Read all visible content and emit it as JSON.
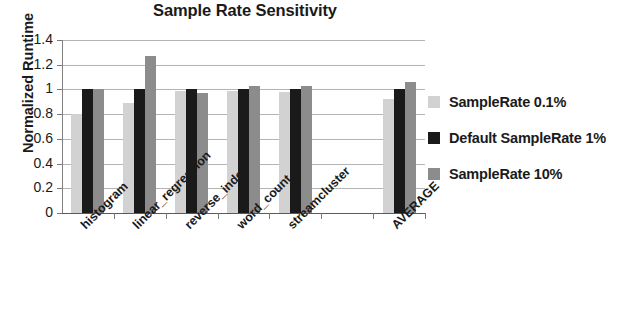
{
  "chart_data": {
    "type": "bar",
    "title": "Sample Rate Sensitivity",
    "xlabel": "",
    "ylabel": "Normalized Runtime",
    "ylim": [
      0,
      1.4
    ],
    "yticks": [
      "0",
      "0.2",
      "0.4",
      "0.6",
      "0.8",
      "1",
      "1.2",
      "1.4"
    ],
    "grid": true,
    "legend_position": "right",
    "categories": [
      "histogram",
      "linear_regression",
      "reverse_index",
      "word_count",
      "streamcluster",
      "",
      "AVERAGE"
    ],
    "series": [
      {
        "name": "SampleRate 0.1%",
        "color": "#d2d2d2",
        "values": [
          0.8,
          0.89,
          0.99,
          0.99,
          0.98,
          null,
          0.92
        ]
      },
      {
        "name": "Default SampleRate 1%",
        "color": "#1a1a1a",
        "values": [
          1.0,
          1.0,
          1.0,
          1.0,
          1.0,
          null,
          1.0
        ]
      },
      {
        "name": "SampleRate 10%",
        "color": "#8c8c8c",
        "values": [
          1.0,
          1.27,
          0.97,
          1.03,
          1.03,
          null,
          1.06
        ]
      }
    ]
  },
  "legend": {
    "items": [
      {
        "label": "SampleRate 0.1%"
      },
      {
        "label": "Default SampleRate 1%"
      },
      {
        "label": "SampleRate 10%"
      }
    ]
  }
}
